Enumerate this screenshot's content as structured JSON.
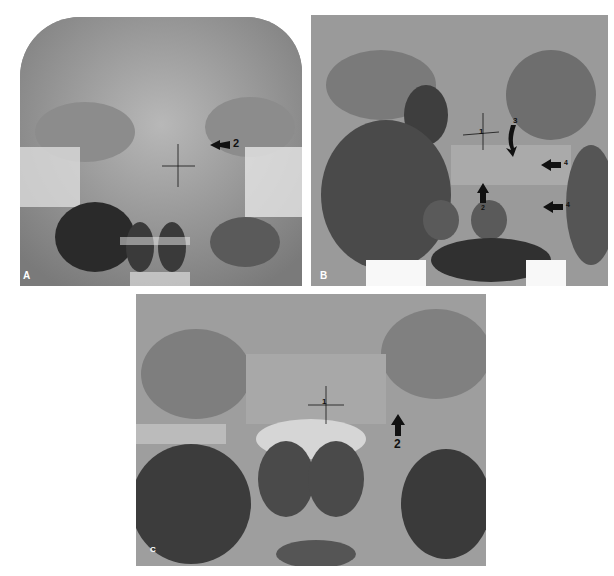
{
  "figure": {
    "panels": [
      {
        "id": "A",
        "label": "A",
        "description": "Frontal radiograph of skull/paranasal region",
        "annotations": [
          {
            "type": "crosshair",
            "number": "1"
          },
          {
            "type": "arrow",
            "direction": "left",
            "number": "2"
          }
        ]
      },
      {
        "id": "B",
        "label": "B",
        "description": "Magnified frontal radiograph of sphenoid region",
        "annotations": [
          {
            "type": "crosshair",
            "number": "1"
          },
          {
            "type": "arrow",
            "direction": "up",
            "number": "2"
          },
          {
            "type": "curved-arrow",
            "direction": "down",
            "number": "3"
          },
          {
            "type": "arrow",
            "direction": "left",
            "number": "4"
          },
          {
            "type": "arrow",
            "direction": "left",
            "number": "4"
          }
        ]
      },
      {
        "id": "C",
        "label": "C",
        "description": "Tomographic frontal view of sphenoid region",
        "annotations": [
          {
            "type": "crosshair",
            "number": "1"
          },
          {
            "type": "arrow",
            "direction": "up",
            "number": "2"
          }
        ]
      }
    ]
  }
}
